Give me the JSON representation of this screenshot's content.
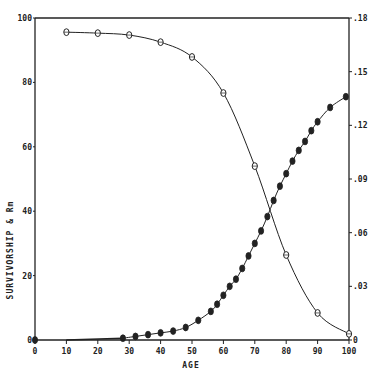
{
  "chart_data": {
    "type": "line",
    "title": "",
    "xlabel": "AGE",
    "ylabel": "SURVIVORSHIP & Rm",
    "xlim": [
      0,
      100
    ],
    "ylim": [
      0,
      100
    ],
    "y2lim": [
      0,
      0.18
    ],
    "grid": false,
    "legend": null,
    "x_ticks": [
      0,
      10,
      20,
      30,
      40,
      50,
      60,
      70,
      80,
      90,
      100
    ],
    "x_tick_labels": [
      "0",
      "10",
      "20",
      "30",
      "40",
      "50",
      "60",
      "70",
      "80",
      "90",
      "100"
    ],
    "y_ticks": [
      0,
      20,
      40,
      60,
      80,
      100
    ],
    "y_tick_labels": [
      "0",
      "20",
      "40",
      "60",
      "80",
      "100"
    ],
    "y2_ticks": [
      0,
      0.03,
      0.06,
      0.09,
      0.12,
      0.15,
      0.18
    ],
    "y2_tick_labels": [
      "0",
      ".03",
      ".06",
      ".09",
      ".12",
      ".15",
      ".18"
    ],
    "series": [
      {
        "name": "Survivorship",
        "axis": "left",
        "marker": "open-circle",
        "x": [
          10,
          20,
          30,
          40,
          50,
          60,
          70,
          80,
          90,
          100
        ],
        "values": [
          95.6,
          95.3,
          94.7,
          92.5,
          87.9,
          76.7,
          54.0,
          26.4,
          8.4,
          1.9
        ]
      },
      {
        "name": "Rm",
        "axis": "right",
        "marker": "filled-circle",
        "x": [
          0,
          28,
          32,
          36,
          40,
          44,
          48,
          52,
          56,
          58,
          60,
          62,
          64,
          66,
          68,
          70,
          72,
          74,
          76,
          78,
          80,
          82,
          84,
          86,
          88,
          90,
          94,
          99
        ],
        "values": [
          0,
          0.001,
          0.002,
          0.003,
          0.004,
          0.005,
          0.007,
          0.011,
          0.016,
          0.02,
          0.025,
          0.03,
          0.034,
          0.04,
          0.047,
          0.054,
          0.061,
          0.069,
          0.078,
          0.086,
          0.093,
          0.1,
          0.106,
          0.111,
          0.117,
          0.122,
          0.13,
          0.136
        ]
      }
    ]
  },
  "plot": {
    "left": 35,
    "right": 349,
    "top": 18,
    "bottom": 340,
    "colors": {
      "ink": "#222222",
      "background": "#ffffff"
    }
  }
}
